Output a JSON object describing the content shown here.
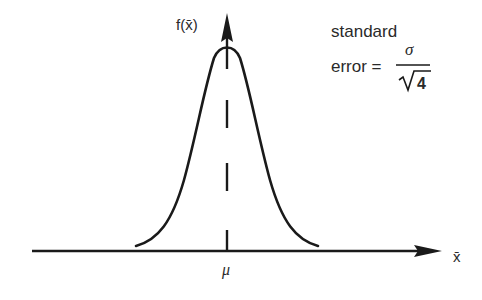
{
  "diagram": {
    "type": "sampling-distribution",
    "y_axis_label": "f(x̄)",
    "x_axis_label": "x̄",
    "mean_label": "μ",
    "annotation": {
      "line1": "standard",
      "line2_prefix": "error =",
      "numerator": "σ",
      "denominator_radical": "√",
      "denominator_value": "4"
    },
    "colors": {
      "ink": "#1a1a1a",
      "background": "#ffffff"
    }
  }
}
